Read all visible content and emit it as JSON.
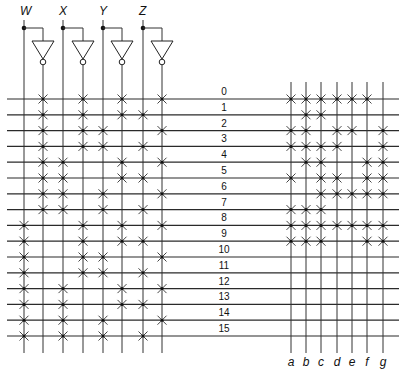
{
  "diagram": {
    "inputs": [
      {
        "name": "W",
        "x": 24,
        "inv_x": 43
      },
      {
        "name": "X",
        "x": 63,
        "inv_x": 83
      },
      {
        "name": "Y",
        "x": 103,
        "inv_x": 122
      },
      {
        "name": "Z",
        "x": 143,
        "inv_x": 162
      }
    ],
    "input_columns_order": [
      "W",
      "W'",
      "X",
      "X'",
      "Y",
      "Y'",
      "Z",
      "Z'"
    ],
    "rows": [
      "0",
      "1",
      "2",
      "3",
      "4",
      "5",
      "6",
      "7",
      "8",
      "9",
      "10",
      "11",
      "12",
      "13",
      "14",
      "15"
    ],
    "outputs": [
      {
        "name": "a",
        "x": 291
      },
      {
        "name": "b",
        "x": 306
      },
      {
        "name": "c",
        "x": 321
      },
      {
        "name": "d",
        "x": 337
      },
      {
        "name": "e",
        "x": 352
      },
      {
        "name": "f",
        "x": 367
      },
      {
        "name": "g",
        "x": 383
      }
    ],
    "and_plane_note": "Each row i has crosses on the true or complemented line of W,X,Y,Z matching the binary code of i (W = MSB).",
    "or_plane": {
      "0": [
        "a",
        "b",
        "c",
        "d",
        "e",
        "f"
      ],
      "1": [
        "b",
        "c"
      ],
      "2": [
        "a",
        "b",
        "d",
        "e",
        "g"
      ],
      "3": [
        "a",
        "b",
        "c",
        "d",
        "g"
      ],
      "4": [
        "b",
        "c",
        "f",
        "g"
      ],
      "5": [
        "a",
        "c",
        "d",
        "f",
        "g"
      ],
      "6": [
        "c",
        "d",
        "e",
        "f",
        "g"
      ],
      "7": [
        "a",
        "b",
        "c"
      ],
      "8": [
        "a",
        "b",
        "c",
        "d",
        "e",
        "f",
        "g"
      ],
      "9": [
        "a",
        "b",
        "c",
        "f",
        "g"
      ],
      "10": [],
      "11": [],
      "12": [],
      "13": [],
      "14": [],
      "15": []
    },
    "colors": {
      "line": "#333333",
      "background": "#ffffff"
    }
  }
}
